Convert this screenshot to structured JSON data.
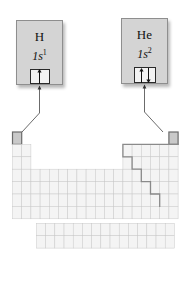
{
  "figure": {
    "background_color": "#ffffff"
  },
  "callouts": [
    {
      "id": "hydrogen",
      "symbol": "H",
      "subshell": "1s",
      "electron_count": "1",
      "orbital_label": "1s orbital box",
      "spins": [
        "up"
      ],
      "box_color": "#d4d4d4",
      "border_color": "#8e8e8e",
      "points_to": "hydrogen-cell"
    },
    {
      "id": "helium",
      "symbol": "He",
      "subshell": "1s",
      "electron_count": "2",
      "orbital_label": "1s orbital box",
      "spins": [
        "up",
        "down"
      ],
      "box_color": "#d4d4d4",
      "border_color": "#8e8e8e",
      "points_to": "helium-cell"
    }
  ],
  "periodic_table": {
    "columns": 18,
    "rows": 7,
    "cell_fill": "#f4f4f4",
    "cell_stroke": "#c9c9c9",
    "highlight_fill": "#c9c9c9",
    "highlight_stroke": "#6b6b6b",
    "metalloid_line_color": "#8a8a8a",
    "highlighted_cells": [
      {
        "name": "hydrogen-cell",
        "group": 1,
        "period": 1
      },
      {
        "name": "helium-cell",
        "group": 18,
        "period": 1
      }
    ],
    "f_block": {
      "rows": 2,
      "columns": 15
    }
  }
}
